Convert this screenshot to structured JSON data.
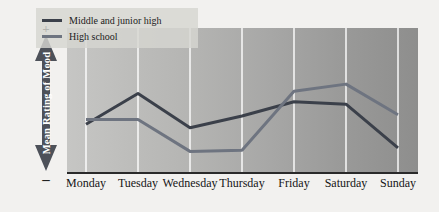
{
  "chart_data": {
    "type": "line",
    "title": "",
    "xlabel": "",
    "ylabel": "Mean Rating of Mood",
    "categories": [
      "Monday",
      "Tuesday",
      "Wednesday",
      "Thursday",
      "Friday",
      "Saturday",
      "Sunday"
    ],
    "axis_top_symbol": "+",
    "axis_bottom_symbol": "–",
    "ylim": [
      0,
      100
    ],
    "y_axis_ticks": [],
    "grid": "vertical",
    "legend_position": "top-left",
    "series": [
      {
        "name": "Middle and junior high",
        "color": "#3b404a",
        "values": [
          32,
          58,
          29,
          39,
          51,
          49,
          12
        ]
      },
      {
        "name": "High school",
        "color": "#6e7480",
        "values": [
          36,
          36,
          9,
          10,
          60,
          66,
          40
        ]
      }
    ]
  },
  "legend": {
    "items": [
      {
        "label": "Middle and junior high",
        "color": "#3b404a"
      },
      {
        "label": "High school",
        "color": "#6e7480"
      }
    ]
  },
  "yaxis": {
    "label": "Mean Rating of Mood",
    "plus": "+",
    "minus": "–",
    "arrow_color": "#4d5159"
  },
  "xaxis": {
    "labels": [
      "Monday",
      "Tuesday",
      "Wednesday",
      "Thursday",
      "Friday",
      "Saturday",
      "Sunday"
    ]
  },
  "colors": {
    "background": "#f2f1ef",
    "plot_left": "#c6c6c4",
    "plot_right": "#8e8e8d",
    "gridline": "#ffffff",
    "axis": "#2a2a2a",
    "legend_panel": "#d6d5d1"
  }
}
